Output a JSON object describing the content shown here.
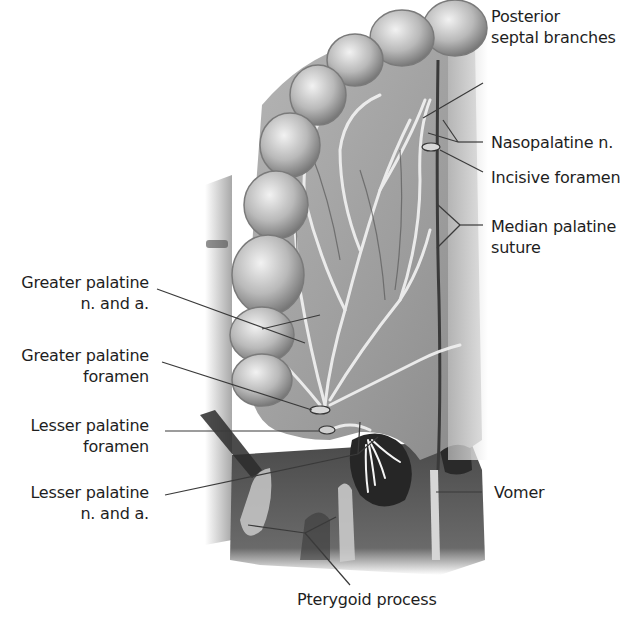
{
  "figure": {
    "colors": {
      "background": "#ffffff",
      "tissue_light": "#d8d8d8",
      "tissue_mid": "#a9a9a9",
      "tissue_dark": "#5a5a5a",
      "cavity": "#2e2e2e",
      "vessel": "#eeeeee",
      "leader_line": "#3a3a3a",
      "text": "#1e1e1e"
    },
    "labels": {
      "posterior_septal": {
        "line1": "Posterior",
        "line2": "septal branches"
      },
      "nasopalatine": {
        "line1": "Nasopalatine n."
      },
      "incisive_foramen": {
        "line1": "Incisive foramen"
      },
      "median_palatine": {
        "line1": "Median palatine",
        "line2": "suture"
      },
      "greater_palatine_na": {
        "line1": "Greater palatine",
        "line2": "n. and a."
      },
      "greater_palatine_foramen": {
        "line1": "Greater palatine",
        "line2": "foramen"
      },
      "lesser_palatine_foramen": {
        "line1": "Lesser palatine",
        "line2": "foramen"
      },
      "lesser_palatine_na": {
        "line1": "Lesser palatine",
        "line2": "n. and a."
      },
      "vomer": {
        "line1": "Vomer"
      },
      "pterygoid": {
        "line1": "Pterygoid process"
      }
    }
  }
}
